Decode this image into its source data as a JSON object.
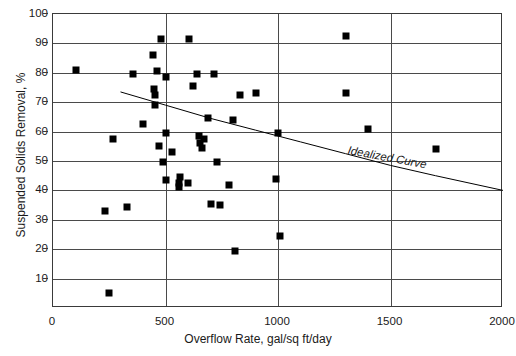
{
  "chart_data": {
    "type": "scatter",
    "title": "",
    "xlabel": "Overflow Rate, gal/sq ft/day",
    "ylabel": "Suspended Solids Removal, %",
    "xlim": [
      0,
      2000
    ],
    "ylim": [
      0,
      100
    ],
    "xticks": [
      0,
      500,
      1000,
      1500,
      2000
    ],
    "yticks": [
      10,
      20,
      30,
      40,
      50,
      60,
      70,
      80,
      90,
      100
    ],
    "grid": "horizontal-and-vertical",
    "legend": "none",
    "annotations": [
      {
        "text": "Idealized Curve",
        "x": 1120,
        "y": 57,
        "style": "italic"
      }
    ],
    "series": [
      {
        "name": "Observed data",
        "marker": "filled-square",
        "color": "#000000",
        "points": [
          [
            100,
            81
          ],
          [
            230,
            33
          ],
          [
            250,
            5
          ],
          [
            265,
            57.5
          ],
          [
            330,
            34.5
          ],
          [
            355,
            79.5
          ],
          [
            400,
            62.5
          ],
          [
            445,
            86
          ],
          [
            450,
            74.5
          ],
          [
            452,
            72.5
          ],
          [
            455,
            69
          ],
          [
            460,
            80.5
          ],
          [
            470,
            55
          ],
          [
            480,
            91.5
          ],
          [
            490,
            49.5
          ],
          [
            500,
            78.5
          ],
          [
            500,
            59.5
          ],
          [
            500,
            43.5
          ],
          [
            530,
            53
          ],
          [
            560,
            41
          ],
          [
            562,
            42.5
          ],
          [
            565,
            44.5
          ],
          [
            600,
            42.5
          ],
          [
            605,
            91.5
          ],
          [
            620,
            75.5
          ],
          [
            640,
            79.5
          ],
          [
            650,
            58.5
          ],
          [
            655,
            56
          ],
          [
            660,
            54.5
          ],
          [
            670,
            57.5
          ],
          [
            690,
            64.5
          ],
          [
            700,
            35.5
          ],
          [
            715,
            79.5
          ],
          [
            730,
            49.5
          ],
          [
            740,
            35
          ],
          [
            780,
            42
          ],
          [
            800,
            64
          ],
          [
            810,
            19.5
          ],
          [
            830,
            72.5
          ],
          [
            900,
            73
          ],
          [
            990,
            44
          ],
          [
            1000,
            59.5
          ],
          [
            1010,
            24.5
          ],
          [
            1300,
            92.5
          ],
          [
            1300,
            73
          ],
          [
            1400,
            61
          ],
          [
            1700,
            54
          ]
        ]
      }
    ],
    "curve": {
      "name": "Idealized Curve",
      "type": "line",
      "color": "#000000",
      "points": [
        [
          300,
          73.5
        ],
        [
          500,
          69
        ],
        [
          700,
          64.5
        ],
        [
          900,
          60.5
        ],
        [
          1100,
          56.5
        ],
        [
          1300,
          52.5
        ],
        [
          1500,
          48.5
        ],
        [
          1700,
          45
        ],
        [
          2000,
          40
        ]
      ]
    }
  },
  "axis": {
    "y_label": "Suspended Solids Removal, %",
    "x_label": "Overflow Rate, gal/sq ft/day",
    "y_ticks": [
      "100",
      "90",
      "80",
      "70",
      "60",
      "50",
      "40",
      "30",
      "20",
      "10"
    ],
    "x_ticks": [
      "0",
      "500",
      "1000",
      "1500",
      "2000"
    ]
  },
  "annotation": {
    "curve_label": "Idealized Curve"
  }
}
